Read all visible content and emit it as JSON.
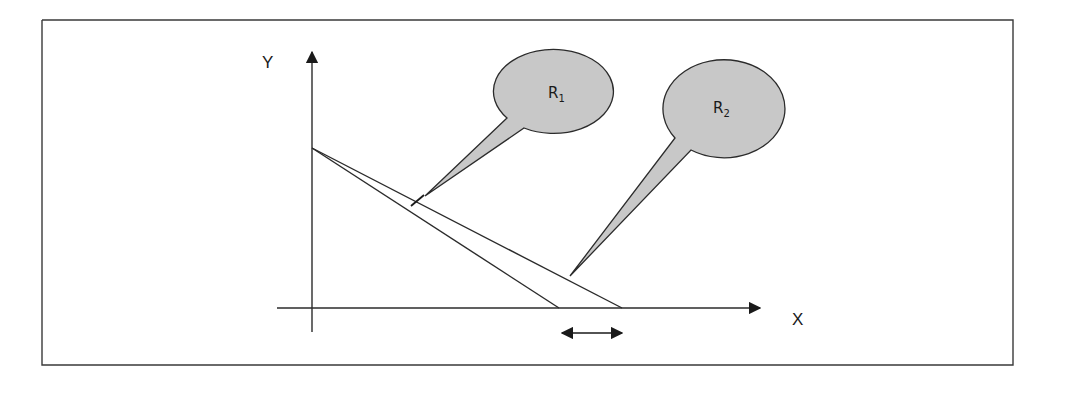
{
  "figure": {
    "axes": {
      "x_label": "X",
      "y_label": "Y"
    },
    "regions": [
      {
        "id": "R1",
        "label": "R",
        "subscript": "1"
      },
      {
        "id": "R2",
        "label": "R",
        "subscript": "2"
      }
    ],
    "annotations": {
      "interval_arrow": "double-headed arrow marking the interval between the two line intercepts on the X axis"
    },
    "colors": {
      "stroke": "#2b2b2b",
      "callout_fill": "#c8c8c8",
      "background": "#ffffff"
    }
  }
}
